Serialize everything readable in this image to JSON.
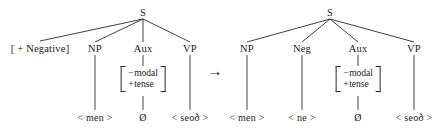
{
  "figure": {
    "transform_arrow": "→",
    "arrow_name": "rightward-arrow"
  },
  "left_tree": {
    "root": "S",
    "side_condition": "[ + Negative]",
    "nodes": [
      {
        "label": "NP"
      },
      {
        "label": "Aux"
      },
      {
        "label": "VP"
      }
    ],
    "aux_features": {
      "row1_sign": "−",
      "row1_feature": "modal",
      "row2_sign": "+",
      "row2_feature": "tense"
    },
    "terminals": [
      {
        "label": "< men >"
      },
      {
        "label": "Ø"
      },
      {
        "label": "< seoð >"
      }
    ]
  },
  "right_tree": {
    "root": "S",
    "nodes": [
      {
        "label": "NP"
      },
      {
        "label": "Neg"
      },
      {
        "label": "Aux"
      },
      {
        "label": "VP"
      }
    ],
    "aux_features": {
      "row1_sign": "−",
      "row1_feature": "modal",
      "row2_sign": "+",
      "row2_feature": "tense"
    },
    "terminals": [
      {
        "label": "< men >"
      },
      {
        "label": "< ne >"
      },
      {
        "label": "Ø"
      },
      {
        "label": "< seoð >"
      }
    ]
  }
}
